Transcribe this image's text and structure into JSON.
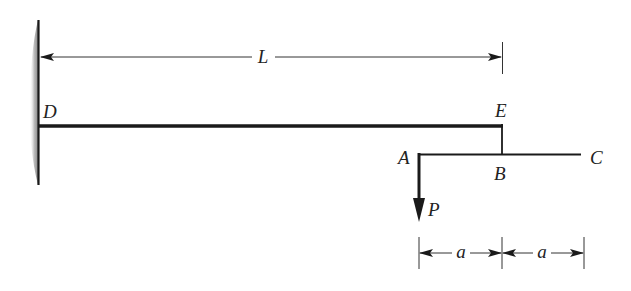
{
  "diagram": {
    "colors": {
      "line": "#1a1a1a",
      "dim": "#333333",
      "wall_shade": "#9a9a9a"
    },
    "labels": {
      "D": "D",
      "E": "E",
      "A": "A",
      "B": "B",
      "C": "C",
      "P": "P",
      "L": "L",
      "a1": "a",
      "a2": "a"
    }
  }
}
